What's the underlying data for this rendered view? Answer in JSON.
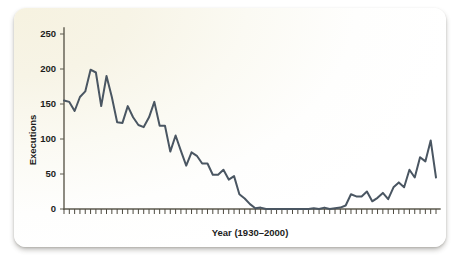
{
  "figure": {
    "background_top_left": "#f6f2e0",
    "background_bottom_right": "#ffffff",
    "line_color": "#4a5662",
    "axis_color": "#5d5a4e",
    "text_color": "#1d1d1c"
  },
  "chart_data": {
    "type": "line",
    "title": "",
    "xlabel": "Year (1930–2000)",
    "ylabel": "Executions",
    "xlim": [
      1930,
      2000
    ],
    "ylim": [
      0,
      250
    ],
    "yticks": [
      0,
      50,
      100,
      150,
      200,
      250
    ],
    "ytick_labels": [
      "0",
      "50",
      "100",
      "150",
      "200",
      "250"
    ],
    "xticks_labeled": false,
    "xtick_minor_count": 71,
    "grid": false,
    "legend": null,
    "series": [
      {
        "name": "Executions",
        "x": [
          1930,
          1931,
          1932,
          1933,
          1934,
          1935,
          1936,
          1937,
          1938,
          1939,
          1940,
          1941,
          1942,
          1943,
          1944,
          1945,
          1946,
          1947,
          1948,
          1949,
          1950,
          1951,
          1952,
          1953,
          1954,
          1955,
          1956,
          1957,
          1958,
          1959,
          1960,
          1961,
          1962,
          1963,
          1964,
          1965,
          1966,
          1967,
          1968,
          1969,
          1970,
          1971,
          1972,
          1973,
          1974,
          1975,
          1976,
          1977,
          1978,
          1979,
          1980,
          1981,
          1982,
          1983,
          1984,
          1985,
          1986,
          1987,
          1988,
          1989,
          1990,
          1991,
          1992,
          1993,
          1994,
          1995,
          1996,
          1997,
          1998,
          1999,
          2000
        ],
        "values": [
          155,
          153,
          140,
          160,
          168,
          199,
          195,
          147,
          190,
          160,
          124,
          123,
          147,
          131,
          120,
          117,
          131,
          153,
          119,
          119,
          82,
          105,
          83,
          62,
          81,
          76,
          65,
          65,
          49,
          49,
          56,
          42,
          47,
          21,
          15,
          7,
          1,
          2,
          0,
          0,
          0,
          0,
          0,
          0,
          0,
          0,
          0,
          1,
          0,
          2,
          0,
          1,
          2,
          5,
          21,
          18,
          18,
          25,
          11,
          16,
          23,
          14,
          31,
          38,
          31,
          56,
          45,
          74,
          68,
          98,
          45
        ]
      }
    ]
  }
}
